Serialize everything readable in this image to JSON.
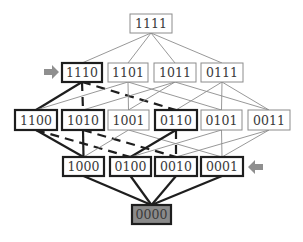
{
  "diagram": {
    "type": "hasse-lattice",
    "colors": {
      "thin": "#8c8c8c",
      "thick": "#1e1e1e",
      "text": "#3a3a3a",
      "bottom_fill": "#8a8a8a",
      "arrow": "#8f8f8f",
      "background": "#ffffff"
    },
    "nodes": [
      {
        "id": "1111",
        "label": "1111",
        "x": 130,
        "y": 14,
        "w": 42,
        "h": 19,
        "style": "thin"
      },
      {
        "id": "1110",
        "label": "1110",
        "x": 62,
        "y": 63,
        "w": 40,
        "h": 19,
        "style": "thick"
      },
      {
        "id": "1101",
        "label": "1101",
        "x": 108,
        "y": 63,
        "w": 40,
        "h": 19,
        "style": "thin"
      },
      {
        "id": "1011",
        "label": "1011",
        "x": 154,
        "y": 63,
        "w": 42,
        "h": 19,
        "style": "thin"
      },
      {
        "id": "0111",
        "label": "0111",
        "x": 201,
        "y": 63,
        "w": 42,
        "h": 19,
        "style": "thin"
      },
      {
        "id": "1100",
        "label": "1100",
        "x": 15,
        "y": 110,
        "w": 42,
        "h": 20,
        "style": "thick"
      },
      {
        "id": "1010",
        "label": "1010",
        "x": 62,
        "y": 110,
        "w": 42,
        "h": 20,
        "style": "thick"
      },
      {
        "id": "1001",
        "label": "1001",
        "x": 108,
        "y": 110,
        "w": 41,
        "h": 20,
        "style": "thin"
      },
      {
        "id": "0110",
        "label": "0110",
        "x": 155,
        "y": 110,
        "w": 42,
        "h": 20,
        "style": "thick"
      },
      {
        "id": "0101",
        "label": "0101",
        "x": 201,
        "y": 110,
        "w": 41,
        "h": 20,
        "style": "thin"
      },
      {
        "id": "0011",
        "label": "0011",
        "x": 248,
        "y": 110,
        "w": 42,
        "h": 20,
        "style": "thin"
      },
      {
        "id": "1000",
        "label": "1000",
        "x": 63,
        "y": 157,
        "w": 41,
        "h": 19,
        "style": "thick"
      },
      {
        "id": "0100",
        "label": "0100",
        "x": 110,
        "y": 157,
        "w": 41,
        "h": 19,
        "style": "thick"
      },
      {
        "id": "0010",
        "label": "0010",
        "x": 155,
        "y": 157,
        "w": 42,
        "h": 19,
        "style": "thick"
      },
      {
        "id": "0001",
        "label": "0001",
        "x": 201,
        "y": 157,
        "w": 42,
        "h": 19,
        "style": "thick"
      },
      {
        "id": "0000",
        "label": "0000",
        "x": 132,
        "y": 205,
        "w": 39,
        "h": 19,
        "style": "filled"
      }
    ],
    "edges": [
      {
        "from": "1111",
        "to": "1110",
        "style": "thin"
      },
      {
        "from": "1111",
        "to": "1101",
        "style": "thin"
      },
      {
        "from": "1111",
        "to": "1011",
        "style": "thin"
      },
      {
        "from": "1111",
        "to": "0111",
        "style": "thin"
      },
      {
        "from": "1110",
        "to": "1100",
        "style": "thick"
      },
      {
        "from": "1110",
        "to": "1010",
        "style": "thick-dashed"
      },
      {
        "from": "1110",
        "to": "0110",
        "style": "thick-dashed"
      },
      {
        "from": "1101",
        "to": "1100",
        "style": "thin"
      },
      {
        "from": "1101",
        "to": "1001",
        "style": "thin"
      },
      {
        "from": "1101",
        "to": "0101",
        "style": "thin"
      },
      {
        "from": "1011",
        "to": "1010",
        "style": "thin"
      },
      {
        "from": "1011",
        "to": "1001",
        "style": "thin"
      },
      {
        "from": "1011",
        "to": "0011",
        "style": "thin"
      },
      {
        "from": "0111",
        "to": "0110",
        "style": "thin"
      },
      {
        "from": "0111",
        "to": "0101",
        "style": "thin"
      },
      {
        "from": "0111",
        "to": "0011",
        "style": "thin"
      },
      {
        "from": "1100",
        "to": "1000",
        "style": "thick"
      },
      {
        "from": "1100",
        "to": "0100",
        "style": "thick-dashed"
      },
      {
        "from": "1010",
        "to": "1000",
        "style": "thick"
      },
      {
        "from": "1010",
        "to": "0010",
        "style": "thick-dashed"
      },
      {
        "from": "1001",
        "to": "1000",
        "style": "thin"
      },
      {
        "from": "1001",
        "to": "0001",
        "style": "thin"
      },
      {
        "from": "0110",
        "to": "0100",
        "style": "thick"
      },
      {
        "from": "0110",
        "to": "0010",
        "style": "thick-dashed"
      },
      {
        "from": "0101",
        "to": "0100",
        "style": "thin"
      },
      {
        "from": "0101",
        "to": "0001",
        "style": "thin"
      },
      {
        "from": "0011",
        "to": "0010",
        "style": "thin"
      },
      {
        "from": "0011",
        "to": "0001",
        "style": "thin"
      },
      {
        "from": "1000",
        "to": "0000",
        "style": "thick"
      },
      {
        "from": "0100",
        "to": "0000",
        "style": "thick"
      },
      {
        "from": "0010",
        "to": "0000",
        "style": "thick"
      },
      {
        "from": "0001",
        "to": "0000",
        "style": "thick"
      }
    ],
    "arrows": [
      {
        "name": "arrow-right-to-1110",
        "direction": "right",
        "x": 44,
        "y": 72,
        "target": "1110"
      },
      {
        "name": "arrow-left-to-0001",
        "direction": "left",
        "x": 263,
        "y": 167,
        "target": "0001"
      }
    ]
  }
}
